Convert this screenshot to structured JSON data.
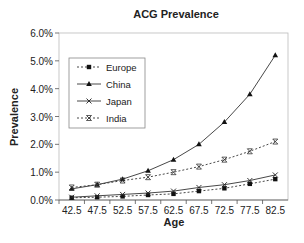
{
  "chart_data": {
    "type": "line",
    "title": "ACG Prevalence",
    "xlabel": "Age",
    "ylabel": "Prevalence",
    "ylim": [
      0,
      6
    ],
    "yticks": [
      "0.0%",
      "1.0%",
      "2.0%",
      "3.0%",
      "4.0%",
      "5.0%",
      "6.0%"
    ],
    "categories": [
      "42.5",
      "47.5",
      "52.5",
      "57.5",
      "62.5",
      "67.5",
      "72.5",
      "77.5",
      "82.5"
    ],
    "legend_position": "upper-left-inside",
    "grid": false,
    "series": [
      {
        "name": "Europe",
        "style": "dotted",
        "marker": "square",
        "values": [
          0.08,
          0.1,
          0.13,
          0.18,
          0.22,
          0.32,
          0.42,
          0.58,
          0.75
        ]
      },
      {
        "name": "China",
        "style": "solid",
        "marker": "triangle",
        "values": [
          0.4,
          0.55,
          0.75,
          1.05,
          1.45,
          2.0,
          2.8,
          3.8,
          5.2
        ]
      },
      {
        "name": "Japan",
        "style": "solid",
        "marker": "x",
        "values": [
          0.1,
          0.15,
          0.2,
          0.25,
          0.32,
          0.45,
          0.55,
          0.7,
          0.9
        ]
      },
      {
        "name": "India",
        "style": "dotted",
        "marker": "asterisk",
        "values": [
          0.45,
          0.55,
          0.7,
          0.82,
          1.0,
          1.2,
          1.45,
          1.75,
          2.1
        ]
      }
    ]
  }
}
